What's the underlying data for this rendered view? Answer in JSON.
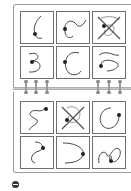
{
  "diagram": {
    "type": "spiral-notebook-card-grid",
    "colors": {
      "stroke": "#333333",
      "frame": "#9a9a9a",
      "card_border": "#6e6e6e",
      "spiral": "#c8c8c8"
    },
    "top_page": {
      "cards": [
        {
          "id": 1,
          "shape": "left-bulge curve",
          "crossed": false
        },
        {
          "id": 2,
          "shape": "wave arc",
          "crossed": false
        },
        {
          "id": 3,
          "shape": "loop",
          "crossed": true
        },
        {
          "id": 4,
          "shape": "reversed-3",
          "crossed": false
        },
        {
          "id": 5,
          "shape": "C-arc",
          "crossed": false
        },
        {
          "id": 6,
          "shape": "S-wave",
          "crossed": false
        }
      ]
    },
    "bottom_page": {
      "cards": [
        {
          "id": 7,
          "shape": "squiggle",
          "crossed": false
        },
        {
          "id": 8,
          "shape": "loop",
          "crossed": true
        },
        {
          "id": 9,
          "shape": "open circle",
          "crossed": false
        },
        {
          "id": 10,
          "shape": "hook S",
          "crossed": false
        },
        {
          "id": 11,
          "shape": "U-arc",
          "crossed": false
        },
        {
          "id": 12,
          "shape": "spiral squiggle",
          "crossed": false
        }
      ]
    },
    "spiral_rings": {
      "left_group": 3,
      "right_group": 3
    },
    "footer_icon": "circle-minus-icon"
  }
}
